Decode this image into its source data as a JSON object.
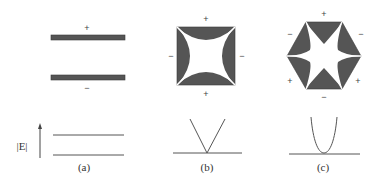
{
  "figure": {
    "colors": {
      "electrode": "#555555",
      "electrode_edge": "#3a3a3a",
      "line": "#555555",
      "text": "#333333",
      "background": "#ffffff"
    },
    "panels": [
      {
        "id": "a",
        "caption": "(a)",
        "electrode_shape": "parallel-plates",
        "top_sign": "+",
        "bottom_sign": "−",
        "dispersion": "two-flat-levels"
      },
      {
        "id": "b",
        "caption": "(b)",
        "electrode_shape": "quadrupole-square",
        "signs": {
          "top": "+",
          "bottom": "+",
          "left": "−",
          "right": "−"
        },
        "dispersion": "linear-v"
      },
      {
        "id": "c",
        "caption": "(c)",
        "electrode_shape": "hexapole-hexagon",
        "signs": {
          "top": "+",
          "upper_left": "−",
          "upper_right": "−",
          "lower_left": "+",
          "lower_right": "+",
          "bottom": "−"
        },
        "dispersion": "parabola"
      }
    ],
    "axis_label": "|E|"
  }
}
